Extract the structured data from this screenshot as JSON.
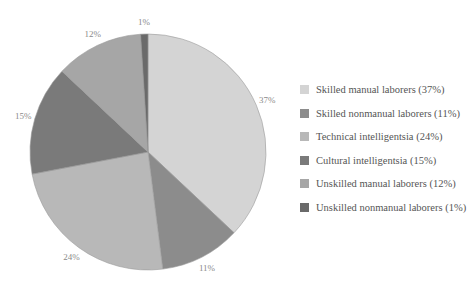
{
  "chart_data": {
    "type": "pie",
    "title": "",
    "start_angle_deg": 0,
    "direction": "clockwise",
    "slices": [
      {
        "label": "Skilled manual laborers",
        "value": 37,
        "display": "37%",
        "color": "#d4d4d4"
      },
      {
        "label": "Skilled nonmanual laborers",
        "value": 11,
        "display": "11%",
        "color": "#8c8c8c"
      },
      {
        "label": "Technical intelligentsia",
        "value": 24,
        "display": "24%",
        "color": "#b8b8b8"
      },
      {
        "label": "Cultural intelligentsia",
        "value": 15,
        "display": "15%",
        "color": "#7a7a7a"
      },
      {
        "label": "Unskilled manual laborers",
        "value": 12,
        "display": "12%",
        "color": "#a6a6a6"
      },
      {
        "label": "Unskilled nonmanual laborers",
        "value": 1,
        "display": "1%",
        "color": "#6a6a6a"
      }
    ],
    "legend": {
      "position": "right",
      "entries": [
        "Skilled manual laborers (37%)",
        "Skilled nonmanual laborers (11%)",
        "Technical intelligentsia (24%)",
        "Cultural intelligentsia (15%)",
        "Unskilled manual laborers (12%)",
        "Unskilled nonmanual laborers (1%)"
      ]
    },
    "xlabel": "",
    "ylabel": ""
  },
  "pie_geometry": {
    "cx": 148,
    "cy": 152,
    "r": 118,
    "stroke": "#9a9a9a"
  }
}
